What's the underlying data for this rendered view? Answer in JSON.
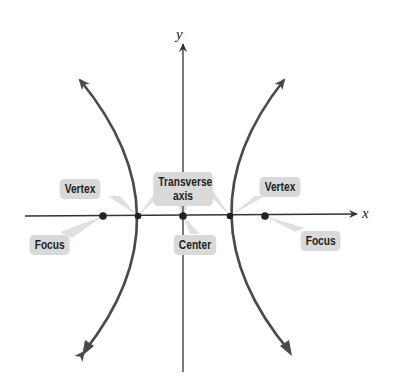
{
  "diagram": {
    "axes": {
      "x_label": "x",
      "y_label": "y"
    },
    "labels": {
      "vertex_left": "Vertex",
      "vertex_right": "Vertex",
      "focus_left": "Focus",
      "focus_right": "Focus",
      "transverse_axis_line1": "Transverse",
      "transverse_axis_line2": "axis",
      "center": "Center"
    },
    "points": {
      "center": [
        183,
        216
      ],
      "vertex_left": [
        138,
        216
      ],
      "vertex_right": [
        230,
        216
      ],
      "focus_left": [
        103,
        216
      ],
      "focus_right": [
        265,
        216
      ]
    },
    "colors": {
      "curve": "#4a4a4a",
      "axis": "#333333",
      "label_bg": "#d9d9d9",
      "pointer": "#d9d9d9"
    }
  }
}
